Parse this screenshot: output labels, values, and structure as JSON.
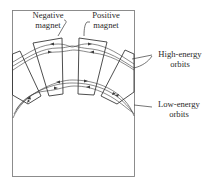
{
  "figure": {
    "labels": {
      "negative_magnet": [
        "Negative",
        "magnet"
      ],
      "positive_magnet": [
        "Positive",
        "magnet"
      ],
      "high_energy_orbits": [
        "High-energy",
        "orbits"
      ],
      "low_energy_orbits": [
        "Low-energy",
        "orbits"
      ]
    },
    "elements": {
      "frame": "rectangular border",
      "magnets": [
        "left-outer magnet",
        "negative magnet",
        "positive magnet",
        "right-outer magnet"
      ],
      "orbit_groups": [
        "high-energy orbits",
        "low-energy orbits"
      ]
    },
    "colors": {
      "line": "#3a3a3a",
      "frame": "#777777",
      "background": "#ffffff"
    }
  }
}
